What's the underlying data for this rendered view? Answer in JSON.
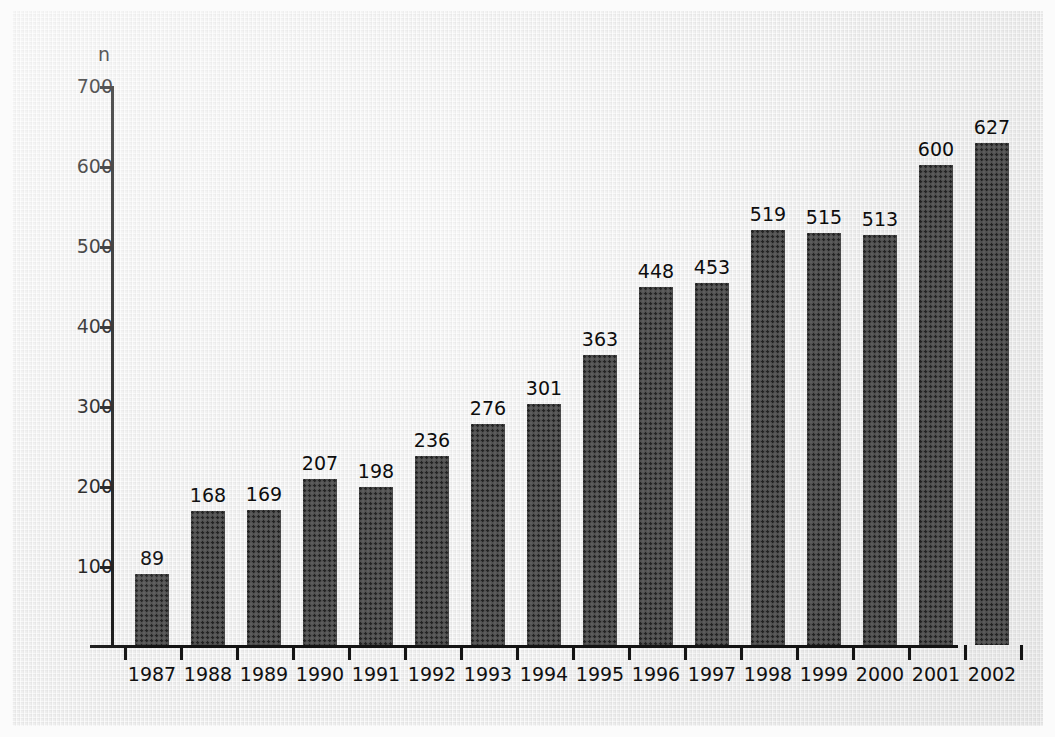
{
  "chart_data": {
    "type": "bar",
    "title": "",
    "subtitle": "",
    "xlabel": "",
    "ylabel": "n",
    "ylim": [
      0,
      700
    ],
    "yticks": [
      100,
      200,
      300,
      400,
      500,
      600,
      700
    ],
    "grid": false,
    "legend": null,
    "categories": [
      "1987",
      "1988",
      "1989",
      "1990",
      "1991",
      "1992",
      "1993",
      "1994",
      "1995",
      "1996",
      "1997",
      "1998",
      "1999",
      "2000",
      "2001",
      "2002"
    ],
    "values": [
      89,
      168,
      169,
      207,
      198,
      236,
      276,
      301,
      363,
      448,
      453,
      519,
      515,
      513,
      600,
      627
    ],
    "value_labels": [
      "89",
      "168",
      "169",
      "207",
      "198",
      "236",
      "276",
      "301",
      "363",
      "448",
      "453",
      "519",
      "515",
      "513",
      "600",
      "627"
    ],
    "bar_color": "#4e4e4e",
    "axis_color": "#141414",
    "background_color": "#ededed"
  }
}
